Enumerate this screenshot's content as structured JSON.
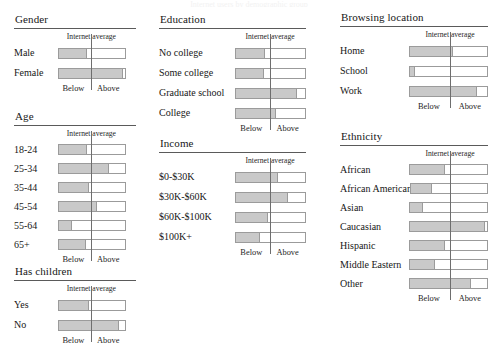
{
  "figure": {
    "clipped_title": "Internet users by demographic group",
    "axis_left_label": "Below",
    "axis_right_label": "Above",
    "reference_caption": "Internet average",
    "fill_color": "#c9c9c9",
    "border_color": "#9b9b9b",
    "reference_line_color": "#6e6e6e",
    "rule_color": "#5a5a5a"
  },
  "chart_data": {
    "type": "bar",
    "title": "Internet users by demographic group",
    "xlabel": "",
    "ylabel": "",
    "orientation": "horizontal",
    "grid": false,
    "legend": null,
    "value_units": "fraction of track width (0-1)",
    "reference_marker": {
      "label": "Internet average",
      "position": 0.55,
      "left_side_label": "Below",
      "right_side_label": "Above"
    },
    "panels": [
      {
        "title": "Gender",
        "categories": [
          "Male",
          "Female"
        ],
        "values": [
          0.4,
          0.93
        ]
      },
      {
        "title": "Age",
        "categories": [
          "18-24",
          "25-34",
          "35-44",
          "45-54",
          "55-64",
          "65+"
        ],
        "values": [
          0.4,
          0.72,
          0.43,
          0.55,
          0.18,
          0.38
        ]
      },
      {
        "title": "Has children",
        "categories": [
          "Yes",
          "No"
        ],
        "values": [
          0.43,
          0.87
        ]
      },
      {
        "title": "Education",
        "categories": [
          "No college",
          "Some college",
          "Graduate school",
          "College"
        ],
        "values": [
          0.4,
          0.38,
          0.85,
          0.55
        ]
      },
      {
        "title": "Income",
        "categories": [
          "$0-$30K",
          "$30K-$60K",
          "$60K-$100K",
          "$100K+"
        ],
        "values": [
          0.58,
          0.72,
          0.43,
          0.33
        ]
      },
      {
        "title": "Browsing location",
        "categories": [
          "Home",
          "School",
          "Work"
        ],
        "values": [
          0.52,
          0.05,
          0.83
        ]
      },
      {
        "title": "Ethnicity",
        "categories": [
          "African",
          "African American",
          "Asian",
          "Caucasian",
          "Hispanic",
          "Middle Eastern",
          "Other"
        ],
        "values": [
          0.42,
          0.25,
          0.15,
          0.93,
          0.42,
          0.3,
          0.75
        ]
      }
    ]
  },
  "panels": {
    "gender": {
      "title": "Gender",
      "caption": "Internet average",
      "below": "Below",
      "above": "Above",
      "rows": [
        {
          "label": "Male",
          "value": 0.4
        },
        {
          "label": "Female",
          "value": 0.93
        }
      ]
    },
    "age": {
      "title": "Age",
      "caption": "Internet average",
      "below": "Below",
      "above": "Above",
      "rows": [
        {
          "label": "18-24",
          "value": 0.4
        },
        {
          "label": "25-34",
          "value": 0.72
        },
        {
          "label": "35-44",
          "value": 0.43
        },
        {
          "label": "45-54",
          "value": 0.55
        },
        {
          "label": "55-64",
          "value": 0.18
        },
        {
          "label": "65+",
          "value": 0.38
        }
      ]
    },
    "has_children": {
      "title": "Has children",
      "caption": "Internet average",
      "below": "Below",
      "above": "Above",
      "rows": [
        {
          "label": "Yes",
          "value": 0.43
        },
        {
          "label": "No",
          "value": 0.87
        }
      ]
    },
    "education": {
      "title": "Education",
      "caption": "Internet average",
      "below": "Below",
      "above": "Above",
      "rows": [
        {
          "label": "No college",
          "value": 0.4
        },
        {
          "label": "Some college",
          "value": 0.38
        },
        {
          "label": "Graduate school",
          "value": 0.85
        },
        {
          "label": "College",
          "value": 0.55
        }
      ]
    },
    "income": {
      "title": "Income",
      "caption": "Internet average",
      "below": "Below",
      "above": "Above",
      "rows": [
        {
          "label": "$0-$30K",
          "value": 0.58
        },
        {
          "label": "$30K-$60K",
          "value": 0.72
        },
        {
          "label": "$60K-$100K",
          "value": 0.43
        },
        {
          "label": "$100K+",
          "value": 0.33
        }
      ]
    },
    "browsing_location": {
      "title": "Browsing location",
      "caption": "Internet average",
      "below": "Below",
      "above": "Above",
      "rows": [
        {
          "label": "Home",
          "value": 0.52
        },
        {
          "label": "School",
          "value": 0.05
        },
        {
          "label": "Work",
          "value": 0.83
        }
      ]
    },
    "ethnicity": {
      "title": "Ethnicity",
      "caption": "Internet average",
      "below": "Below",
      "above": "Above",
      "rows": [
        {
          "label": "African",
          "value": 0.42
        },
        {
          "label": "African American",
          "value": 0.25
        },
        {
          "label": "Asian",
          "value": 0.15
        },
        {
          "label": "Caucasian",
          "value": 0.93
        },
        {
          "label": "Hispanic",
          "value": 0.42
        },
        {
          "label": "Middle Eastern",
          "value": 0.3
        },
        {
          "label": "Other",
          "value": 0.75
        }
      ]
    }
  }
}
